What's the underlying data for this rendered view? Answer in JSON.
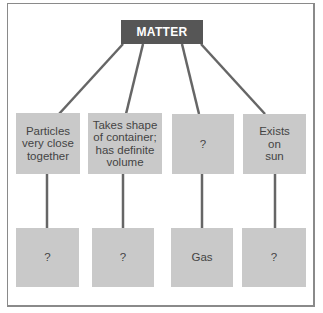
{
  "diagram": {
    "root": {
      "label": "MATTER"
    },
    "top_row": [
      {
        "label": "Particles\nvery close\ntogether"
      },
      {
        "label": "Takes shape\nof container;\nhas definite\nvolume"
      },
      {
        "label": "?"
      },
      {
        "label": "Exists\non\nsun"
      }
    ],
    "bottom_row": [
      {
        "label": "?"
      },
      {
        "label": "?"
      },
      {
        "label": "Gas"
      },
      {
        "label": "?"
      }
    ]
  },
  "colors": {
    "root_fill": "#565656",
    "box_fill": "#c9c9c9",
    "connector": "#666666"
  }
}
